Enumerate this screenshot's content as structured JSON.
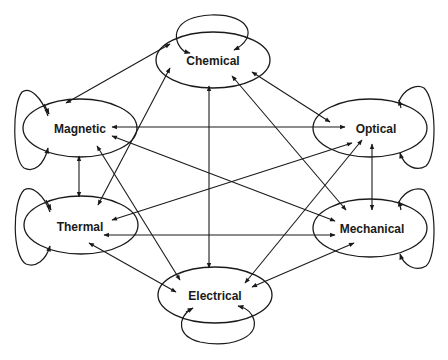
{
  "diagram": {
    "type": "energy-domain-coupling-graph",
    "nodes": [
      {
        "id": "chemical",
        "label": "Chemical",
        "cx": 213,
        "cy": 60,
        "rx": 57,
        "ry": 28
      },
      {
        "id": "magnetic",
        "label": "Magnetic",
        "cx": 80,
        "cy": 128,
        "rx": 57,
        "ry": 29
      },
      {
        "id": "optical",
        "label": "Optical",
        "cx": 370,
        "cy": 128,
        "rx": 57,
        "ry": 29
      },
      {
        "id": "thermal",
        "label": "Thermal",
        "cx": 81,
        "cy": 225,
        "rx": 57,
        "ry": 29
      },
      {
        "id": "mechanical",
        "label": "Mechanical",
        "cx": 370,
        "cy": 228,
        "rx": 57,
        "ry": 29
      },
      {
        "id": "electrical",
        "label": "Electrical",
        "cx": 215,
        "cy": 295,
        "rx": 57,
        "ry": 28
      }
    ],
    "edges": [
      {
        "from": "chemical",
        "to": "magnetic",
        "bidirectional": true
      },
      {
        "from": "chemical",
        "to": "optical",
        "bidirectional": true
      },
      {
        "from": "chemical",
        "to": "thermal",
        "bidirectional": true
      },
      {
        "from": "chemical",
        "to": "mechanical",
        "bidirectional": true
      },
      {
        "from": "chemical",
        "to": "electrical",
        "bidirectional": true
      },
      {
        "from": "magnetic",
        "to": "optical",
        "bidirectional": true
      },
      {
        "from": "magnetic",
        "to": "thermal",
        "bidirectional": true
      },
      {
        "from": "magnetic",
        "to": "mechanical",
        "bidirectional": true
      },
      {
        "from": "magnetic",
        "to": "electrical",
        "bidirectional": true
      },
      {
        "from": "optical",
        "to": "thermal",
        "bidirectional": true
      },
      {
        "from": "optical",
        "to": "mechanical",
        "bidirectional": true
      },
      {
        "from": "optical",
        "to": "electrical",
        "bidirectional": true
      },
      {
        "from": "thermal",
        "to": "mechanical",
        "bidirectional": true
      },
      {
        "from": "thermal",
        "to": "electrical",
        "bidirectional": true
      },
      {
        "from": "mechanical",
        "to": "electrical",
        "bidirectional": true
      }
    ],
    "self_loops": [
      "chemical",
      "magnetic",
      "optical",
      "thermal",
      "mechanical",
      "electrical"
    ],
    "colors": {
      "stroke": "#1a1a1a",
      "background": "#ffffff",
      "text": "#1a1a1a"
    }
  }
}
